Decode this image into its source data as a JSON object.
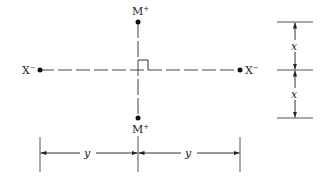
{
  "diagram": {
    "type": "charge-arrangement",
    "center": {
      "x": 138,
      "y": 70
    },
    "charges": [
      {
        "id": "top",
        "label": "M",
        "sign": "+",
        "x": 138,
        "y": 22
      },
      {
        "id": "bottom",
        "label": "M",
        "sign": "+",
        "x": 138,
        "y": 118
      },
      {
        "id": "left",
        "label": "X",
        "sign": "−",
        "x": 40,
        "y": 70
      },
      {
        "id": "right",
        "label": "X",
        "sign": "−",
        "x": 240,
        "y": 70
      }
    ],
    "vertical_dimensions": {
      "label_top": "x",
      "label_bottom": "x"
    },
    "horizontal_dimensions": {
      "label_left": "y",
      "label_right": "y"
    },
    "right_angle_marker": true
  },
  "colors": {
    "line": "#333333",
    "dot": "#111111"
  }
}
